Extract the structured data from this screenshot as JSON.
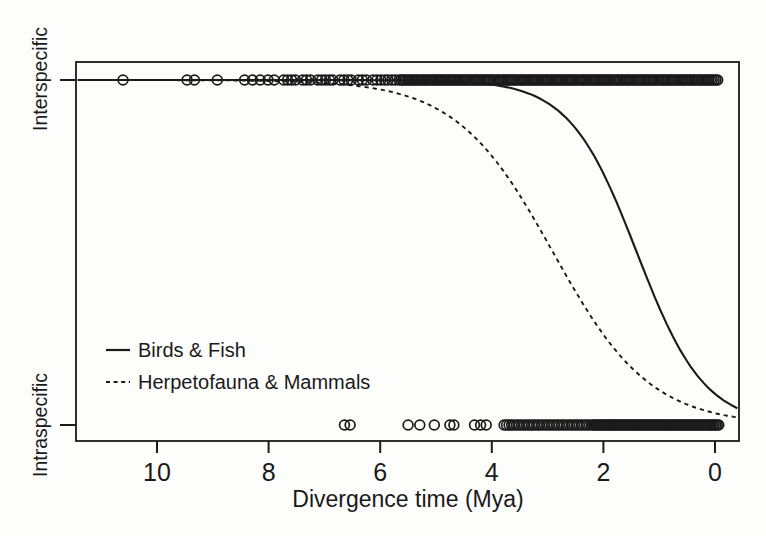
{
  "chart_data": {
    "type": "scatter",
    "title": "",
    "xlabel": "Divergence time (Mya)",
    "x_ticks": [
      10,
      8,
      6,
      4,
      2,
      0
    ],
    "x_axis_reversed": true,
    "x_range_mya": [
      11.42,
      -0.43
    ],
    "grid": false,
    "legend_position": "inside-lower-left",
    "y_levels": {
      "top_label": "Interspecific",
      "top_value": 1,
      "bottom_label": "Intraspecific",
      "bottom_value": 0
    },
    "series": [
      {
        "name": "Birds & Fish",
        "line": "solid",
        "curve": "logistic",
        "midpoint_mya": 1.4,
        "slope_per_mya": 1.65
      },
      {
        "name": "Herpetofauna & Mammals",
        "line": "dashed",
        "curve": "logistic",
        "midpoint_mya": 2.9,
        "slope_per_mya": 1.15
      }
    ],
    "marker": {
      "shape": "open-circle",
      "color": "#1a1a1a"
    },
    "points": {
      "interspecific_mya": {
        "resolved": [
          10.61,
          9.46,
          9.33,
          8.92,
          8.43,
          8.29,
          8.15,
          8.01,
          7.9,
          7.73,
          7.66,
          7.59,
          7.52,
          7.39,
          7.32,
          7.25,
          7.12,
          7.05,
          6.98,
          6.91,
          6.85,
          6.72,
          6.65,
          6.58,
          6.52,
          6.39,
          6.32,
          6.25,
          6.13,
          6.06,
          5.99,
          5.92,
          5.86,
          5.79,
          5.73
        ],
        "dense_ranges": [
          {
            "from": 5.66,
            "to": -0.08,
            "step": 0.033
          }
        ]
      },
      "intraspecific_mya": {
        "resolved": [
          6.64,
          6.54,
          5.5,
          5.29,
          5.03,
          4.75,
          4.68,
          4.31,
          4.2,
          4.1
        ],
        "dense_ranges": [
          {
            "from": 3.78,
            "to": 2.24,
            "step": 0.045
          },
          {
            "from": 2.2,
            "to": -0.08,
            "step": 0.028
          }
        ]
      }
    }
  }
}
